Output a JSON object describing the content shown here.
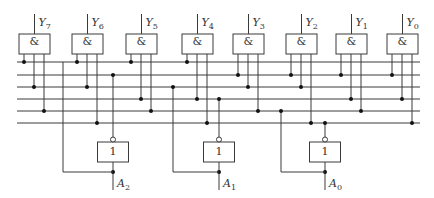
{
  "diagram": {
    "colors": {
      "wire": "#3a3a3a",
      "dot": "#111111",
      "background": "#ffffff"
    },
    "bus_lines_y": [
      62,
      75,
      87,
      99,
      111,
      123
    ],
    "bus_x_range": [
      17,
      420
    ],
    "and_gates": [
      {
        "output": "Y",
        "index": "7",
        "symbol": "&",
        "x": 19,
        "inputs_to_lines": [
          0,
          2,
          4
        ]
      },
      {
        "output": "Y",
        "index": "6",
        "symbol": "&",
        "x": 72,
        "inputs_to_lines": [
          0,
          2,
          5
        ]
      },
      {
        "output": "Y",
        "index": "5",
        "symbol": "&",
        "x": 126,
        "inputs_to_lines": [
          0,
          3,
          4
        ]
      },
      {
        "output": "Y",
        "index": "4",
        "symbol": "&",
        "x": 182,
        "inputs_to_lines": [
          0,
          3,
          5
        ]
      },
      {
        "output": "Y",
        "index": "3",
        "symbol": "&",
        "x": 233,
        "inputs_to_lines": [
          1,
          2,
          4
        ]
      },
      {
        "output": "Y",
        "index": "2",
        "symbol": "&",
        "x": 286,
        "inputs_to_lines": [
          1,
          2,
          5
        ]
      },
      {
        "output": "Y",
        "index": "1",
        "symbol": "&",
        "x": 336,
        "inputs_to_lines": [
          1,
          3,
          4
        ]
      },
      {
        "output": "Y",
        "index": "0",
        "symbol": "&",
        "x": 387,
        "inputs_to_lines": [
          1,
          3,
          5
        ]
      }
    ],
    "inverters": [
      {
        "input": "A",
        "index": "2",
        "symbol": "1",
        "center_x": 113,
        "bypass_x": 63,
        "bypass_line": 0,
        "out_line": 1
      },
      {
        "input": "A",
        "index": "1",
        "symbol": "1",
        "center_x": 219,
        "bypass_x": 173,
        "bypass_line": 2,
        "out_line": 3
      },
      {
        "input": "A",
        "index": "0",
        "symbol": "1",
        "center_x": 325,
        "bypass_x": 281,
        "bypass_line": 4,
        "out_line": 5
      }
    ]
  }
}
